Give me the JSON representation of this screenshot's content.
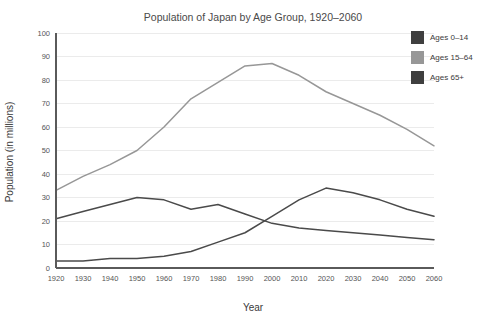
{
  "chart_data": {
    "type": "line",
    "title": "Population of Japan by Age Group, 1920–2060",
    "xlabel": "Year",
    "ylabel": "Population (in millions)",
    "xlim": [
      1920,
      2060
    ],
    "ylim": [
      0,
      100
    ],
    "grid": true,
    "legend_position": "top-right",
    "x": [
      1920,
      1930,
      1940,
      1950,
      1960,
      1970,
      1980,
      1990,
      2000,
      2010,
      2020,
      2030,
      2040,
      2050,
      2060
    ],
    "xticklabels": [
      "1920",
      "1930",
      "1940",
      "1950",
      "1960",
      "1970",
      "1980",
      "1990",
      "2000",
      "2010",
      "2020",
      "2030",
      "2040",
      "2050",
      "2060"
    ],
    "yticks": [
      0,
      10,
      20,
      30,
      40,
      50,
      60,
      70,
      80,
      90,
      100
    ],
    "yticklabels": [
      "0",
      "10",
      "20",
      "30",
      "40",
      "50",
      "60",
      "70",
      "80",
      "90",
      "100"
    ],
    "series": [
      {
        "name": "Ages 0–14",
        "color": "#4a4a4a",
        "values": [
          21,
          24,
          27,
          30,
          29,
          25,
          27,
          23,
          19,
          17,
          16,
          15,
          14,
          13,
          12
        ]
      },
      {
        "name": "Ages 15–64",
        "color": "#979797",
        "values": [
          33,
          39,
          44,
          50,
          60,
          72,
          79,
          86,
          87,
          82,
          75,
          70,
          65,
          59,
          52
        ]
      },
      {
        "name": "Ages 65+",
        "color": "#4a4a4a",
        "values": [
          3,
          3,
          4,
          4,
          5,
          7,
          11,
          15,
          22,
          29,
          34,
          32,
          29,
          25,
          22
        ]
      }
    ]
  },
  "legend": {
    "items": [
      {
        "label": "Ages 0–14",
        "color": "#3f3f3f"
      },
      {
        "label": "Ages 15–64",
        "color": "#979797"
      },
      {
        "label": "Ages 65+",
        "color": "#3f3f3f"
      }
    ]
  }
}
